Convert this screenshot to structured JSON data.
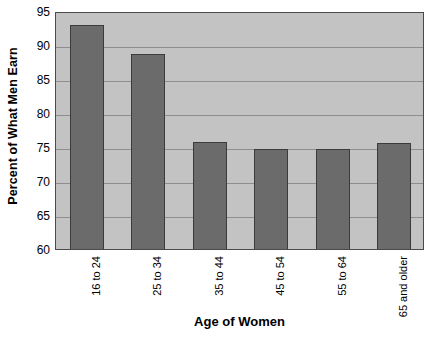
{
  "chart_data": {
    "type": "bar",
    "title": "",
    "xlabel": "Age of Women",
    "ylabel": "Percent of What Men Earn",
    "categories": [
      "16 to 24",
      "25 to 34",
      "35 to 44",
      "45 to 54",
      "55 to 64",
      "65 and older"
    ],
    "values": [
      93.0,
      88.7,
      75.8,
      74.7,
      74.7,
      75.6
    ],
    "ylim": [
      60,
      95
    ],
    "yticks": [
      60,
      65,
      70,
      75,
      80,
      85,
      90,
      95
    ],
    "ytick_labels": [
      "60",
      "65",
      "70",
      "75",
      "80",
      "85",
      "90",
      "95"
    ],
    "grid": true,
    "legend": "none",
    "colors": {
      "bar_fill": "#6b6b6b",
      "bar_edge": "#3b3b3b",
      "plot_background": "#c3c3c3",
      "gridline": "#8e8e8e",
      "axis_border": "#4a4a4a",
      "text": "#000000",
      "page_background": "#ffffff"
    }
  }
}
